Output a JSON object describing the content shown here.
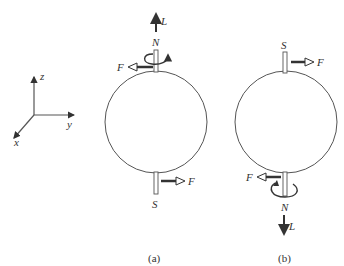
{
  "axes": {
    "z_label": "z",
    "y_label": "y",
    "x_label": "x"
  },
  "panel_a": {
    "caption": "(a)",
    "top_pole": "N",
    "bottom_pole": "S",
    "angular_momentum": "L",
    "top_force": "F",
    "bottom_force": "F"
  },
  "panel_b": {
    "caption": "(b)",
    "top_pole": "S",
    "bottom_pole": "N",
    "angular_momentum": "L",
    "top_force": "F",
    "bottom_force": "F"
  },
  "colors": {
    "line": "#555555",
    "arrow": "#333333"
  }
}
